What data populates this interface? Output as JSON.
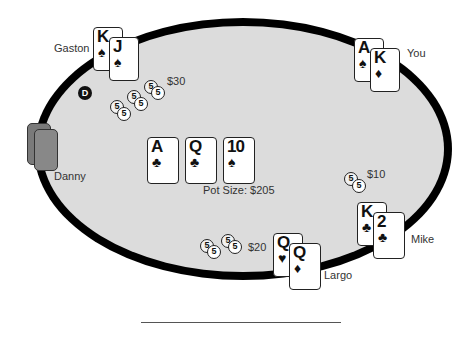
{
  "table": {
    "felt_color": "#dcdcdc",
    "rail_color": "#000000"
  },
  "dealer_button": {
    "label": "D"
  },
  "board": {
    "cards": [
      {
        "rank": "A",
        "suit": "♣",
        "suit_name": "clubs"
      },
      {
        "rank": "Q",
        "suit": "♣",
        "suit_name": "clubs"
      },
      {
        "rank": "10",
        "suit": "♠",
        "suit_name": "spades"
      }
    ],
    "pot_label": "Pot Size: $205"
  },
  "players": {
    "gaston": {
      "name": "Gaston",
      "bet": "$30",
      "cards": [
        {
          "rank": "K",
          "suit": "♠"
        },
        {
          "rank": "J",
          "suit": "♠"
        }
      ],
      "chip_label": "5"
    },
    "you": {
      "name": "You",
      "cards": [
        {
          "rank": "A",
          "suit": "♠"
        },
        {
          "rank": "K",
          "suit": "♦"
        }
      ]
    },
    "danny": {
      "name": "Danny",
      "cards_face_down": true
    },
    "mike": {
      "name": "Mike",
      "bet": "$10",
      "cards": [
        {
          "rank": "K",
          "suit": "♣"
        },
        {
          "rank": "2",
          "suit": "♣"
        }
      ],
      "chip_label": "5"
    },
    "largo": {
      "name": "Largo",
      "bet": "$20",
      "cards": [
        {
          "rank": "Q",
          "suit": "♥"
        },
        {
          "rank": "Q",
          "suit": "♦"
        }
      ],
      "chip_label": "5"
    }
  }
}
